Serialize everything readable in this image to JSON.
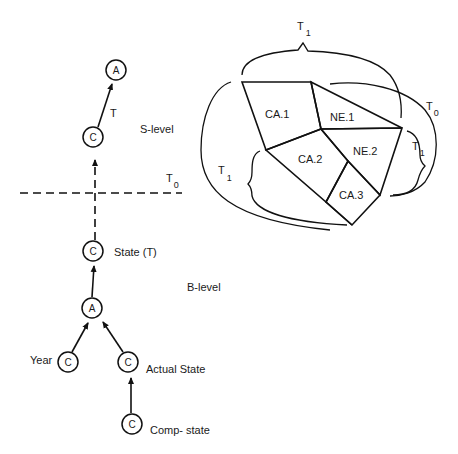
{
  "diagram": {
    "levels": {
      "s_level": "S-level",
      "b_level": "B-level"
    },
    "threshold": {
      "label": "T",
      "subscript": "0"
    },
    "tree": {
      "nodes": [
        {
          "id": "s_top",
          "label": "A",
          "caption": ""
        },
        {
          "id": "s_c",
          "label": "C",
          "caption": ""
        },
        {
          "id": "state_t",
          "label": "C",
          "caption": "State (T)"
        },
        {
          "id": "b_a",
          "label": "A",
          "caption": ""
        },
        {
          "id": "year",
          "label": "C",
          "caption": "Year"
        },
        {
          "id": "actual_state",
          "label": "C",
          "caption": "Actual State"
        },
        {
          "id": "comp_state",
          "label": "C",
          "caption": "Comp- state"
        }
      ],
      "edge_labels": {
        "s_c_to_s_top": "T"
      }
    },
    "map": {
      "regions": [
        {
          "id": "ca1",
          "label": "CA.1"
        },
        {
          "id": "ne1",
          "label": "NE.1"
        },
        {
          "id": "ca2",
          "label": "CA.2"
        },
        {
          "id": "ne2",
          "label": "NE.2"
        },
        {
          "id": "ca3",
          "label": "CA.3"
        }
      ],
      "brackets": [
        {
          "id": "top",
          "label": "T",
          "subscript": "1"
        },
        {
          "id": "right_outer",
          "label": "T",
          "subscript": "0"
        },
        {
          "id": "right_inner",
          "label": "T",
          "subscript": "1"
        },
        {
          "id": "left",
          "label": "T",
          "subscript": "1"
        }
      ]
    }
  }
}
